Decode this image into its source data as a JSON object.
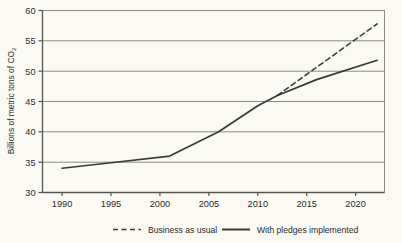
{
  "chart_data": {
    "type": "line",
    "title": "",
    "xlabel": "",
    "ylabel": "Billions of metric tons of CO2",
    "ylabel_main": "Billions of metric tons of CO",
    "ylabel_subscript": "2",
    "xlim": [
      1988,
      2023
    ],
    "ylim": [
      30,
      60
    ],
    "grid": true,
    "grid_axis": "y",
    "legend_position": "bottom",
    "y_ticks": [
      30,
      35,
      40,
      45,
      50,
      55,
      60
    ],
    "y_tick_labels": [
      "30",
      "35",
      "40",
      "45",
      "50",
      "55",
      "60"
    ],
    "x_ticks": [
      1990,
      1995,
      2000,
      2005,
      2010,
      2015,
      2020
    ],
    "x_tick_labels": [
      "1990",
      "1995",
      "2000",
      "2005",
      "2010",
      "2015",
      "2020"
    ],
    "series": [
      {
        "name": "Business as usual",
        "style": "dashed",
        "color": "#3a3a35",
        "x": [
          2012,
          2022.2
        ],
        "values": [
          46.0,
          57.8
        ]
      },
      {
        "name": "With pledges implemented",
        "style": "solid",
        "color": "#3a3a35",
        "x": [
          1990,
          1995,
          2001,
          2006,
          2010,
          2012,
          2016,
          2022.2
        ],
        "values": [
          34.0,
          34.9,
          36.0,
          40.0,
          44.3,
          46.0,
          48.6,
          51.8
        ]
      }
    ]
  },
  "legend": {
    "items": [
      {
        "label": "Business as usual",
        "style": "dashed"
      },
      {
        "label": "With pledges implemented",
        "style": "solid"
      }
    ]
  },
  "colors": {
    "background": "#fbf9f3",
    "axis": "#56564e",
    "gridline": "#8c8c82",
    "line": "#3a3a35",
    "text": "#2b2b28"
  }
}
